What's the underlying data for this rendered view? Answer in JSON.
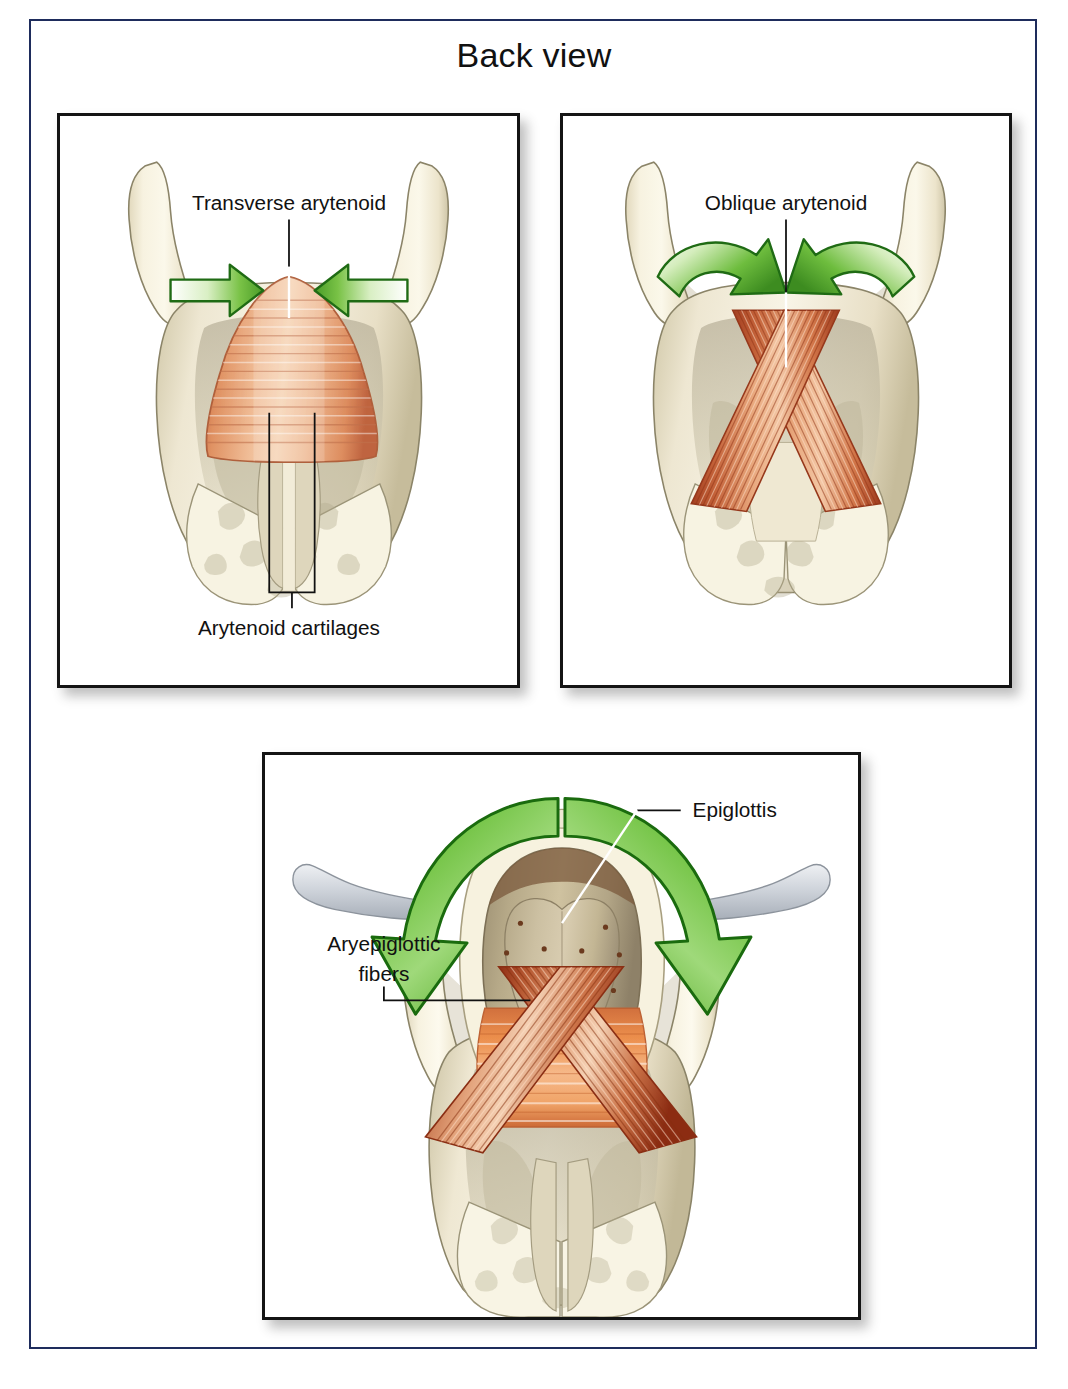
{
  "figure": {
    "title": "Back view",
    "frame_color": "#1e2c5c",
    "panel_border_color": "#141414",
    "background": "#ffffff"
  },
  "palette": {
    "cartilage_light": "#f5f0dc",
    "cartilage_mid": "#e6dec3",
    "cartilage_shadow": "#cdc4a6",
    "cartilage_outline": "#8b8468",
    "muscle_salmon": "#e8a178",
    "muscle_light": "#f2c4a4",
    "muscle_dark": "#b8543a",
    "muscle_deep_red": "#a03a20",
    "arrow_green_dark": "#2e7d22",
    "arrow_green_mid": "#6cbf3f",
    "arrow_green_light": "#ffffff",
    "hyoid_grey": "#c9cdd4",
    "label_text": "#111111",
    "leader_line": "#111111"
  },
  "panels": [
    {
      "id": "transverse",
      "name": "Transverse arytenoid panel",
      "labels": [
        {
          "text": "Transverse arytenoid",
          "x": 232,
          "y": 94
        },
        {
          "text": "Arytenoid cartilages",
          "x": 232,
          "y": 522
        }
      ],
      "arrows": [
        {
          "direction": "right",
          "name": "green-arrow-left"
        },
        {
          "direction": "left",
          "name": "green-arrow-right"
        }
      ]
    },
    {
      "id": "oblique",
      "name": "Oblique arytenoid panel",
      "labels": [
        {
          "text": "Oblique arytenoid",
          "x": 226,
          "y": 94
        }
      ],
      "arrows": [
        {
          "direction": "curved-right",
          "name": "green-curved-arrow-left"
        },
        {
          "direction": "curved-left",
          "name": "green-curved-arrow-right"
        }
      ]
    },
    {
      "id": "aryepiglottic",
      "name": "Aryepiglottic fibers panel",
      "labels": [
        {
          "text": "Epiglottis",
          "x": 432,
          "y": 56
        },
        {
          "text": "Aryepiglottic",
          "x": 76,
          "y": 190
        },
        {
          "text": "fibers",
          "x": 106,
          "y": 222
        }
      ],
      "arrows": [
        {
          "direction": "curved-down-left",
          "name": "green-curved-arrow-left"
        },
        {
          "direction": "curved-down-right",
          "name": "green-curved-arrow-right"
        }
      ]
    }
  ]
}
